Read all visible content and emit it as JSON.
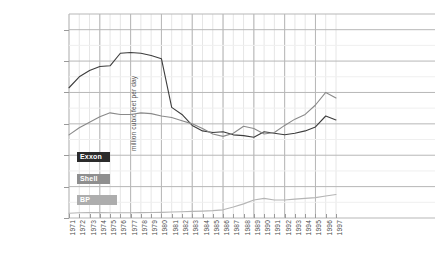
{
  "chart_data": {
    "type": "line",
    "title": "",
    "xlabel": "",
    "ylabel": "million cubic feet per day",
    "ylim": [
      0,
      13000
    ],
    "yticks": [
      0,
      2000,
      4000,
      6000,
      8000,
      10000,
      12000
    ],
    "ytick_labels": [
      "0",
      "2000",
      "4000",
      "6000",
      "8000",
      "10000",
      "12000"
    ],
    "grid": true,
    "legend_position": "inside-left",
    "x": [
      1971,
      1972,
      1973,
      1974,
      1975,
      1976,
      1977,
      1978,
      1979,
      1980,
      1981,
      1982,
      1983,
      1984,
      1985,
      1986,
      1987,
      1988,
      1989,
      1990,
      1991,
      1992,
      1993,
      1994,
      1995,
      1996,
      1997
    ],
    "xtick_labels": [
      "1971",
      "1972",
      "1973",
      "1974",
      "1975",
      "1976",
      "1977",
      "1978",
      "1979",
      "1980",
      "1981",
      "1982",
      "1983",
      "1984",
      "1985",
      "1986",
      "1987",
      "1988",
      "1989",
      "1990",
      "1991",
      "1992",
      "1993",
      "1994",
      "1995",
      "1996",
      "1997"
    ],
    "series": [
      {
        "name": "Exxon",
        "color": "#3d3d3d",
        "values": [
          8300,
          9000,
          9400,
          9650,
          9700,
          10500,
          10550,
          10500,
          10350,
          10150,
          7050,
          6600,
          5900,
          5550,
          5450,
          5500,
          5300,
          5250,
          5150,
          5500,
          5400,
          5300,
          5400,
          5550,
          5800,
          6500,
          6250
        ]
      },
      {
        "name": "Shell",
        "color": "#8a8a8a",
        "values": [
          5300,
          5750,
          6100,
          6450,
          6700,
          6600,
          6600,
          6700,
          6650,
          6500,
          6400,
          6200,
          6000,
          5700,
          5350,
          5200,
          5400,
          5850,
          5700,
          5350,
          5450,
          5900,
          6300,
          6600,
          7200,
          8000,
          7650
        ]
      },
      {
        "name": "BP",
        "color": "#b5b5b5",
        "values": [
          300,
          330,
          350,
          340,
          335,
          330,
          330,
          340,
          350,
          360,
          380,
          400,
          420,
          440,
          470,
          520,
          700,
          900,
          1150,
          1250,
          1150,
          1150,
          1200,
          1250,
          1300,
          1400,
          1500
        ]
      }
    ]
  },
  "legend": {
    "items": [
      {
        "label": "Exxon",
        "color": "#2b2b2b"
      },
      {
        "label": "Shell",
        "color": "#8f8f8f"
      },
      {
        "label": "BP",
        "color": "#adadad"
      }
    ]
  },
  "colors": {
    "background": "#ffffff",
    "major_grid": "#b7b7b7",
    "minor_grid": "#e6e6e6",
    "tick_text": "#4a4a4a"
  }
}
